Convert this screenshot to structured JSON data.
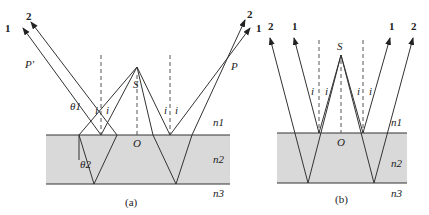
{
  "figure": {
    "panels": [
      {
        "id": "a",
        "caption": "(a)",
        "source_label": "S",
        "origin_label": "O",
        "points": [
          "P'",
          "P"
        ],
        "ray_labels": [
          "1",
          "2",
          "2",
          "1"
        ],
        "angle_labels": [
          "i",
          "i",
          "i",
          "i"
        ],
        "refraction_angles": [
          "θ1",
          "θ2"
        ],
        "media": [
          "n1",
          "n2",
          "n3"
        ]
      },
      {
        "id": "b",
        "caption": "(b)",
        "source_label": "S",
        "origin_label": "O",
        "ray_labels": [
          "2",
          "1",
          "1",
          "2"
        ],
        "angle_labels": [
          "i",
          "i",
          "i",
          "i"
        ],
        "media": [
          "n1",
          "n2",
          "n3"
        ]
      }
    ],
    "colors": {
      "slab": "#d9d9d9",
      "line": "#333333"
    }
  }
}
